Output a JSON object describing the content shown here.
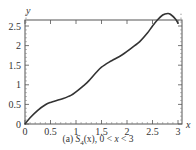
{
  "chart_data": {
    "type": "line",
    "title": "",
    "caption": "(a) S4(x), 0 < x < 3",
    "caption_parts": {
      "prefix": "(a) ",
      "func": "S",
      "sub": "4",
      "arg": "(x), 0 < ",
      "var": "x",
      "suffix": " < 3"
    },
    "xlabel": "x",
    "ylabel": "y",
    "xlim": [
      0,
      3.05
    ],
    "ylim": [
      0,
      2.9
    ],
    "xticks": [
      0,
      0.5,
      1,
      1.5,
      2,
      2.5,
      3
    ],
    "xtick_labels": [
      "0",
      "0.5",
      "1",
      "1.5",
      "2",
      "2.5",
      "3"
    ],
    "yticks": [
      0,
      0.5,
      1,
      1.5,
      2,
      2.5
    ],
    "ytick_labels": [
      "0",
      "0.5",
      "1",
      "1.5",
      "2",
      "2.5"
    ],
    "grid": false,
    "legend": null,
    "series": [
      {
        "name": "S4(x)",
        "color": "#333333",
        "x": [
          0,
          0.1,
          0.25,
          0.4,
          0.5,
          0.65,
          0.75,
          0.9,
          1.0,
          1.15,
          1.25,
          1.4,
          1.5,
          1.65,
          1.75,
          1.9,
          2.0,
          2.15,
          2.25,
          2.4,
          2.5,
          2.6,
          2.7,
          2.8,
          2.85,
          2.95,
          3.0
        ],
        "y": [
          0,
          0.16,
          0.35,
          0.49,
          0.55,
          0.61,
          0.65,
          0.73,
          0.82,
          0.98,
          1.1,
          1.32,
          1.45,
          1.58,
          1.65,
          1.76,
          1.85,
          2.0,
          2.1,
          2.32,
          2.5,
          2.66,
          2.78,
          2.82,
          2.8,
          2.68,
          2.57
        ]
      }
    ]
  },
  "labels": {
    "y_axis": "y",
    "x_axis": "x"
  }
}
